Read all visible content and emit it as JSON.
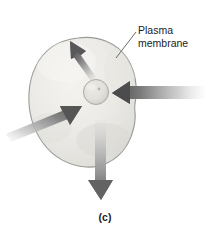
{
  "figure": {
    "kind": "cell-diagram",
    "caption": "(c)",
    "background_color": "#ffffff"
  },
  "labels": {
    "plasma_membrane_line1": "Plasma",
    "plasma_membrane_line2": "membrane"
  },
  "cell": {
    "name": "cell-body",
    "fill_light": "#f2f1ee",
    "fill_mid": "#e4e3df",
    "fill_dark": "#d2d1cc",
    "outline_color": "#9a9a95"
  },
  "nucleus": {
    "name": "nucleus",
    "fill": "#e0dfda",
    "outline_color": "#a8a8a2",
    "nucleolus_color": "#b5b5ae"
  },
  "arrows": [
    {
      "name": "arrow-outward-upleft",
      "direction": "up-left",
      "type": "outward",
      "tip_color": "#59595a",
      "tail_color": "#cfcfcf"
    },
    {
      "name": "arrow-outward-down",
      "direction": "down",
      "type": "outward",
      "tip_color": "#6a6a6b",
      "tail_color": "#d8d8d8"
    },
    {
      "name": "arrow-inward-right",
      "direction": "left",
      "type": "inward",
      "tip_color": "#4f4f50",
      "tail_color": "#e2e2e2"
    },
    {
      "name": "arrow-inward-lowerleft",
      "direction": "up-right",
      "type": "inward",
      "tip_color": "#5a5a5b",
      "tail_color": "#e0e0e0"
    }
  ],
  "leader_line": {
    "name": "plasma-membrane-leader-line",
    "color": "#5a5a5a"
  }
}
